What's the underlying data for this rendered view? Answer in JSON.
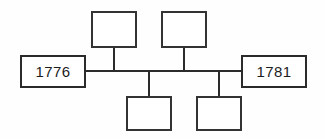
{
  "diagram": {
    "type": "family-tree",
    "background_color": "#fefefe",
    "line_color": "#2b2b2b",
    "text_color": "#1c1c1c",
    "nodes": [
      {
        "id": "left-year",
        "label": "1776",
        "position": "left",
        "x": 20,
        "y": 55,
        "width": 66,
        "height": 33,
        "has_label": true
      },
      {
        "id": "top-left-child",
        "label": "",
        "position": "top-left",
        "x": 91,
        "y": 11,
        "width": 46,
        "height": 37,
        "has_label": false
      },
      {
        "id": "top-right-child",
        "label": "",
        "position": "top-right",
        "x": 161,
        "y": 11,
        "width": 46,
        "height": 37,
        "has_label": false
      },
      {
        "id": "bottom-left-child",
        "label": "",
        "position": "bottom-left",
        "x": 126,
        "y": 96,
        "width": 46,
        "height": 35,
        "has_label": false
      },
      {
        "id": "bottom-right-child",
        "label": "",
        "position": "bottom-right",
        "x": 196,
        "y": 96,
        "width": 46,
        "height": 35,
        "has_label": false
      },
      {
        "id": "right-year",
        "label": "1781",
        "position": "right",
        "x": 241,
        "y": 55,
        "width": 66,
        "height": 33,
        "has_label": true
      }
    ],
    "connectors": [
      {
        "id": "spine",
        "orientation": "horizontal",
        "x": 85,
        "y": 70,
        "length": 157,
        "thickness": 2
      },
      {
        "id": "stem-top-left",
        "orientation": "vertical",
        "x": 113,
        "y": 47,
        "length": 24,
        "thickness": 2
      },
      {
        "id": "stem-top-right",
        "orientation": "vertical",
        "x": 183,
        "y": 47,
        "length": 24,
        "thickness": 2
      },
      {
        "id": "stem-bottom-left",
        "orientation": "vertical",
        "x": 148,
        "y": 70,
        "length": 27,
        "thickness": 2
      },
      {
        "id": "stem-bottom-right",
        "orientation": "vertical",
        "x": 218,
        "y": 70,
        "length": 27,
        "thickness": 2
      }
    ]
  }
}
